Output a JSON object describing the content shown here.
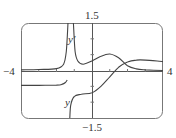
{
  "chart_data": {
    "type": "line",
    "title": "",
    "xlabel": "",
    "ylabel": "",
    "xlim": [
      -4,
      4
    ],
    "ylim": [
      -1.5,
      1.5
    ],
    "grid": false,
    "tick_labels": {
      "x_min": "−4",
      "x_max": "4",
      "y_max": "1.5",
      "y_min": "−1.5"
    },
    "vertical_asymptote_x": -1.2,
    "series": [
      {
        "name": "y′",
        "label": "y′",
        "points_left": [
          [
            -4,
            0.02
          ],
          [
            -3,
            0.03
          ],
          [
            -2,
            0.06
          ],
          [
            -1.6,
            0.2
          ],
          [
            -1.45,
            0.6
          ],
          [
            -1.35,
            1.5
          ]
        ],
        "points_right": [
          [
            -1.05,
            1.5
          ],
          [
            -0.95,
            0.6
          ],
          [
            -0.8,
            0.3
          ],
          [
            -0.5,
            0.2
          ],
          [
            0,
            0.3
          ],
          [
            0.5,
            0.45
          ],
          [
            1.0,
            0.52
          ],
          [
            1.5,
            0.4
          ],
          [
            2,
            0.15
          ],
          [
            2.5,
            0.05
          ],
          [
            3,
            0.02
          ],
          [
            4,
            0.0
          ]
        ]
      },
      {
        "name": "y",
        "label": "y",
        "points_left": [
          [
            -4,
            -0.47
          ],
          [
            -3,
            -0.47
          ],
          [
            -2,
            -0.46
          ],
          [
            -1.7,
            -0.44
          ],
          [
            -1.5,
            -0.38
          ],
          [
            -1.4,
            -0.3
          ]
        ],
        "points_right": [
          [
            -1.25,
            -1.5
          ],
          [
            -1.2,
            -1.1
          ],
          [
            -1.0,
            -0.82
          ],
          [
            -0.6,
            -0.75
          ],
          [
            0,
            -0.7
          ],
          [
            0.5,
            -0.5
          ],
          [
            1.0,
            -0.2
          ],
          [
            1.5,
            0.1
          ],
          [
            2,
            0.27
          ],
          [
            2.5,
            0.33
          ],
          [
            3,
            0.33
          ],
          [
            4,
            0.28
          ]
        ]
      }
    ]
  },
  "labels": {
    "x_min": "−4",
    "x_max": "4",
    "y_max": "1.5",
    "y_min": "−1.5",
    "curve_yprime": "y′",
    "curve_y": "y"
  }
}
